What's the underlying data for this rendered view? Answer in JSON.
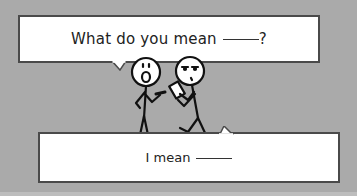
{
  "comic": {
    "top_bubble": {
      "text": "What do you mean",
      "suffix": "?"
    },
    "bottom_bubble": {
      "text": "I mean"
    },
    "characters": [
      "surprised-stick-figure",
      "skeptical-stick-figure-with-phone"
    ]
  },
  "colors": {
    "background": "#aaaaaa",
    "bubble_fill": "#ffffff",
    "bubble_border": "#4a4a4a",
    "text": "#222222"
  }
}
